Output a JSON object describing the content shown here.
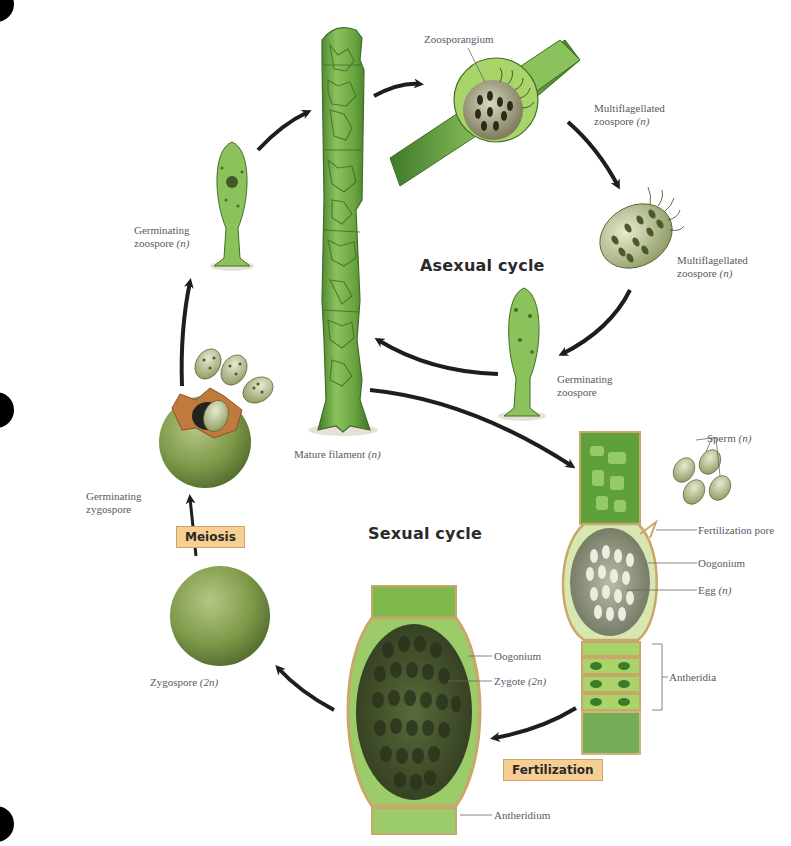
{
  "diagram": {
    "cycles": {
      "asexual": "Asexual cycle",
      "sexual": "Sexual cycle"
    },
    "process_tags": {
      "meiosis": "Meiosis",
      "fertilization": "Fertilization"
    },
    "labels": {
      "zoosporangium": "Zoosporangium",
      "multiflagellated_zoospore_1": {
        "line1": "Multiflagellated",
        "line2": "zoospore",
        "ploidy": "(n)"
      },
      "multiflagellated_zoospore_2": {
        "line1": "Multiflagellated",
        "line2": "zoospore",
        "ploidy": "(n)"
      },
      "germinating_zoospore_left": {
        "line1": "Germinating",
        "line2": "zoospore",
        "ploidy": "(n)"
      },
      "germinating_zoospore_right": {
        "line1": "Germinating",
        "line2": "zoospore"
      },
      "mature_filament": {
        "text": "Mature filament",
        "ploidy": "(n)"
      },
      "sperm": {
        "text": "Sperm",
        "ploidy": "(n)"
      },
      "fertilization_pore": "Fertilization pore",
      "oogonium_right": "Oogonium",
      "egg": {
        "text": "Egg",
        "ploidy": "(n)"
      },
      "antheridia": "Antheridia",
      "germinating_zygospore": {
        "line1": "Germinating",
        "line2": "zygospore"
      },
      "zygospore": {
        "text": "Zygospore",
        "ploidy": "(2n)"
      },
      "oogonium_bottom": "Oogonium",
      "zygote": {
        "text": "Zygote",
        "ploidy": "(2n)"
      },
      "antheridium": "Antheridium"
    },
    "colors": {
      "filament_green": "#5e9e3a",
      "filament_light": "#9ccc6a",
      "cell_wall": "#3f6e24",
      "spore_body": "#c8cfa0",
      "spore_spots": "#4a5a2a",
      "zygospore": "#7c9a48",
      "wall_tan": "#c9a66a",
      "tag_fill": "#f8cf92",
      "arrow": "#1e1e1e",
      "label_text": "#555a66"
    }
  }
}
